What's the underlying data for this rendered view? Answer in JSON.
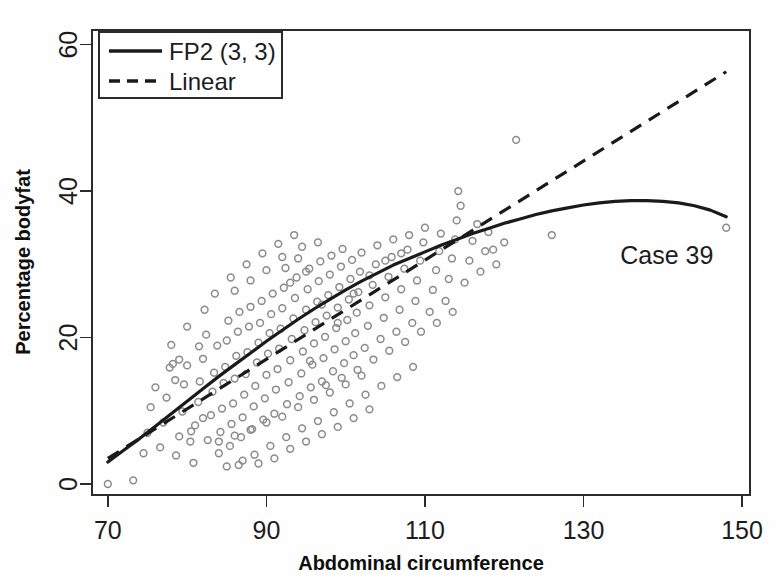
{
  "chart_data": {
    "type": "scatter",
    "title": "",
    "xlabel": "Abdominal circumference",
    "ylabel": "Percentage bodyfat",
    "xlim": [
      68,
      151
    ],
    "ylim": [
      -1.5,
      62
    ],
    "xticks": [
      70,
      90,
      110,
      130,
      150
    ],
    "yticks": [
      0,
      20,
      40,
      60
    ],
    "xtick_labels": [
      "70",
      "90",
      "110",
      "130",
      "150"
    ],
    "ytick_labels": [
      "0",
      "20",
      "40",
      "60"
    ],
    "grid": false,
    "legend_position": "top-left",
    "legend": [
      {
        "label": "FP2 (3, 3)",
        "style": "solid"
      },
      {
        "label": "Linear",
        "style": "dashed"
      }
    ],
    "annotations": [
      {
        "text": "Case 39",
        "x": 140.5,
        "y": 30.0
      }
    ],
    "series": [
      {
        "name": "FP2 (3, 3)",
        "type": "line",
        "style": "solid",
        "points": [
          [
            70,
            3.0
          ],
          [
            72,
            4.6
          ],
          [
            74,
            6.2
          ],
          [
            76,
            7.9
          ],
          [
            78,
            9.6
          ],
          [
            80,
            11.3
          ],
          [
            82,
            13.0
          ],
          [
            84,
            14.7
          ],
          [
            86,
            16.3
          ],
          [
            88,
            17.9
          ],
          [
            90,
            19.5
          ],
          [
            92,
            21.0
          ],
          [
            94,
            22.5
          ],
          [
            96,
            23.9
          ],
          [
            98,
            25.2
          ],
          [
            100,
            26.5
          ],
          [
            102,
            27.7
          ],
          [
            104,
            28.8
          ],
          [
            106,
            29.9
          ],
          [
            108,
            30.8
          ],
          [
            110,
            31.7
          ],
          [
            112,
            32.6
          ],
          [
            114,
            33.4
          ],
          [
            116,
            34.2
          ],
          [
            118,
            34.9
          ],
          [
            120,
            35.6
          ],
          [
            122,
            36.2
          ],
          [
            124,
            36.8
          ],
          [
            126,
            37.3
          ],
          [
            128,
            37.7
          ],
          [
            130,
            38.1
          ],
          [
            132,
            38.4
          ],
          [
            134,
            38.6
          ],
          [
            136,
            38.7
          ],
          [
            138,
            38.7
          ],
          [
            140,
            38.6
          ],
          [
            142,
            38.4
          ],
          [
            144,
            38.0
          ],
          [
            146,
            37.4
          ],
          [
            148,
            36.5
          ]
        ]
      },
      {
        "name": "Linear",
        "type": "line",
        "style": "dashed",
        "points": [
          [
            70,
            3.5
          ],
          [
            148,
            56.3
          ]
        ]
      }
    ],
    "scatter_points": [
      [
        70.0,
        0.0
      ],
      [
        73.2,
        0.5
      ],
      [
        74.5,
        4.2
      ],
      [
        75.0,
        7.0
      ],
      [
        75.4,
        10.5
      ],
      [
        76.0,
        13.2
      ],
      [
        76.6,
        5.0
      ],
      [
        77.0,
        8.4
      ],
      [
        77.4,
        11.8
      ],
      [
        77.8,
        15.9
      ],
      [
        78.2,
        16.4
      ],
      [
        78.6,
        3.9
      ],
      [
        79.0,
        6.5
      ],
      [
        79.4,
        9.9
      ],
      [
        79.6,
        13.6
      ],
      [
        80.0,
        16.2
      ],
      [
        80.4,
        5.8
      ],
      [
        80.8,
        2.9
      ],
      [
        81.0,
        8.0
      ],
      [
        81.4,
        11.2
      ],
      [
        81.6,
        14.0
      ],
      [
        82.0,
        17.1
      ],
      [
        82.4,
        20.4
      ],
      [
        82.6,
        6.0
      ],
      [
        83.0,
        9.4
      ],
      [
        83.2,
        12.6
      ],
      [
        83.4,
        15.2
      ],
      [
        83.8,
        18.9
      ],
      [
        84.0,
        4.2
      ],
      [
        84.2,
        7.1
      ],
      [
        84.4,
        10.3
      ],
      [
        84.6,
        13.8
      ],
      [
        84.8,
        16.0
      ],
      [
        85.0,
        19.6
      ],
      [
        85.2,
        22.3
      ],
      [
        85.4,
        5.2
      ],
      [
        85.6,
        8.2
      ],
      [
        85.8,
        11.0
      ],
      [
        86.0,
        14.4
      ],
      [
        86.2,
        17.5
      ],
      [
        86.4,
        20.8
      ],
      [
        86.6,
        23.5
      ],
      [
        86.8,
        6.4
      ],
      [
        87.0,
        9.1
      ],
      [
        87.2,
        12.2
      ],
      [
        87.4,
        15.0
      ],
      [
        87.6,
        18.0
      ],
      [
        87.8,
        21.5
      ],
      [
        88.0,
        24.2
      ],
      [
        88.2,
        7.5
      ],
      [
        88.4,
        10.6
      ],
      [
        88.6,
        13.4
      ],
      [
        88.8,
        16.6
      ],
      [
        89.0,
        19.3
      ],
      [
        89.2,
        22.0
      ],
      [
        89.4,
        25.0
      ],
      [
        89.6,
        8.8
      ],
      [
        89.8,
        11.7
      ],
      [
        90.0,
        14.9
      ],
      [
        90.2,
        17.8
      ],
      [
        90.4,
        20.6
      ],
      [
        90.6,
        23.2
      ],
      [
        90.8,
        26.0
      ],
      [
        91.0,
        9.6
      ],
      [
        91.2,
        12.9
      ],
      [
        91.4,
        15.7
      ],
      [
        91.6,
        18.5
      ],
      [
        91.8,
        21.2
      ],
      [
        92.0,
        24.0
      ],
      [
        92.2,
        26.8
      ],
      [
        92.4,
        29.5
      ],
      [
        92.6,
        10.9
      ],
      [
        92.8,
        13.9
      ],
      [
        93.0,
        16.9
      ],
      [
        93.2,
        19.8
      ],
      [
        93.4,
        22.6
      ],
      [
        93.6,
        25.4
      ],
      [
        93.8,
        28.2
      ],
      [
        94.0,
        30.8
      ],
      [
        94.2,
        12.0
      ],
      [
        94.4,
        15.1
      ],
      [
        94.6,
        18.1
      ],
      [
        94.8,
        21.0
      ],
      [
        95.0,
        23.8
      ],
      [
        95.2,
        26.6
      ],
      [
        95.4,
        29.4
      ],
      [
        95.6,
        13.2
      ],
      [
        95.8,
        16.3
      ],
      [
        96.0,
        19.2
      ],
      [
        96.2,
        22.1
      ],
      [
        96.4,
        24.9
      ],
      [
        96.6,
        27.7
      ],
      [
        96.8,
        30.4
      ],
      [
        97.0,
        14.0
      ],
      [
        97.2,
        17.2
      ],
      [
        97.4,
        20.1
      ],
      [
        97.6,
        23.0
      ],
      [
        97.8,
        25.8
      ],
      [
        98.0,
        28.6
      ],
      [
        98.2,
        31.2
      ],
      [
        98.4,
        15.4
      ],
      [
        98.6,
        18.4
      ],
      [
        98.8,
        21.3
      ],
      [
        99.0,
        24.1
      ],
      [
        99.2,
        26.9
      ],
      [
        99.4,
        29.7
      ],
      [
        99.6,
        32.1
      ],
      [
        99.8,
        16.5
      ],
      [
        100.0,
        19.5
      ],
      [
        100.2,
        22.4
      ],
      [
        100.4,
        25.2
      ],
      [
        100.6,
        28.0
      ],
      [
        100.8,
        30.6
      ],
      [
        101.0,
        17.6
      ],
      [
        101.2,
        20.6
      ],
      [
        101.4,
        23.4
      ],
      [
        101.6,
        26.2
      ],
      [
        101.8,
        29.0
      ],
      [
        102.0,
        31.6
      ],
      [
        102.4,
        18.6
      ],
      [
        102.8,
        21.6
      ],
      [
        103.0,
        24.4
      ],
      [
        103.4,
        27.2
      ],
      [
        103.8,
        30.0
      ],
      [
        104.0,
        32.6
      ],
      [
        104.4,
        19.8
      ],
      [
        104.8,
        22.7
      ],
      [
        105.0,
        25.5
      ],
      [
        105.4,
        28.3
      ],
      [
        105.8,
        31.0
      ],
      [
        106.0,
        33.4
      ],
      [
        106.4,
        20.8
      ],
      [
        106.8,
        23.8
      ],
      [
        107.0,
        26.6
      ],
      [
        107.4,
        29.4
      ],
      [
        107.8,
        32.0
      ],
      [
        108.0,
        34.0
      ],
      [
        108.4,
        22.0
      ],
      [
        108.8,
        25.0
      ],
      [
        109.0,
        27.8
      ],
      [
        109.4,
        30.5
      ],
      [
        109.8,
        33.0
      ],
      [
        110.0,
        35.0
      ],
      [
        110.6,
        23.5
      ],
      [
        111.0,
        26.5
      ],
      [
        111.4,
        29.2
      ],
      [
        111.8,
        31.8
      ],
      [
        112.0,
        34.2
      ],
      [
        112.6,
        25.0
      ],
      [
        113.0,
        28.0
      ],
      [
        113.4,
        30.8
      ],
      [
        113.8,
        33.4
      ],
      [
        114.0,
        36.0
      ],
      [
        114.5,
        38.0
      ],
      [
        114.2,
        40.0
      ],
      [
        115.0,
        27.5
      ],
      [
        115.6,
        30.5
      ],
      [
        116.0,
        33.2
      ],
      [
        116.6,
        35.5
      ],
      [
        117.0,
        29.0
      ],
      [
        117.6,
        31.8
      ],
      [
        118.0,
        34.4
      ],
      [
        118.6,
        32.0
      ],
      [
        119.0,
        30.0
      ],
      [
        120.0,
        33.0
      ],
      [
        121.5,
        47.0
      ],
      [
        126.0,
        34.0
      ],
      [
        148.0,
        35.0
      ],
      [
        78.0,
        19.0
      ],
      [
        82.2,
        23.8
      ],
      [
        86.0,
        26.4
      ],
      [
        88.0,
        27.8
      ],
      [
        90.0,
        29.2
      ],
      [
        92.0,
        31.0
      ],
      [
        94.5,
        32.4
      ],
      [
        96.5,
        33.0
      ],
      [
        86.5,
        2.6
      ],
      [
        88.5,
        4.0
      ],
      [
        90.5,
        5.2
      ],
      [
        92.5,
        6.4
      ],
      [
        94.5,
        7.6
      ],
      [
        96.5,
        8.6
      ],
      [
        98.5,
        9.8
      ],
      [
        100.5,
        11.0
      ],
      [
        102.5,
        12.2
      ],
      [
        104.5,
        13.4
      ],
      [
        106.5,
        14.6
      ],
      [
        108.5,
        16.0
      ],
      [
        83.5,
        26.0
      ],
      [
        85.5,
        28.2
      ],
      [
        87.5,
        30.0
      ],
      [
        89.5,
        31.5
      ],
      [
        91.5,
        32.8
      ],
      [
        93.5,
        34.0
      ],
      [
        80.0,
        21.5
      ],
      [
        81.5,
        18.8
      ],
      [
        79.0,
        17.0
      ],
      [
        78.5,
        14.2
      ],
      [
        91.0,
        3.5
      ],
      [
        93.0,
        4.8
      ],
      [
        95.0,
        5.8
      ],
      [
        97.0,
        6.8
      ],
      [
        99.0,
        7.8
      ],
      [
        101.0,
        9.0
      ],
      [
        103.0,
        10.2
      ],
      [
        87.0,
        3.2
      ],
      [
        85.0,
        2.4
      ],
      [
        89.0,
        2.8
      ],
      [
        95.5,
        16.8
      ],
      [
        97.5,
        13.5
      ],
      [
        99.5,
        14.5
      ],
      [
        101.5,
        15.6
      ],
      [
        103.5,
        17.0
      ],
      [
        105.5,
        18.2
      ],
      [
        107.5,
        19.4
      ],
      [
        109.5,
        20.8
      ],
      [
        111.5,
        22.0
      ],
      [
        113.5,
        23.5
      ],
      [
        94.0,
        10.5
      ],
      [
        96.0,
        11.5
      ],
      [
        98.0,
        12.5
      ],
      [
        100.0,
        13.6
      ],
      [
        102.0,
        14.8
      ],
      [
        92.0,
        9.2
      ],
      [
        90.0,
        8.4
      ],
      [
        88.0,
        7.4
      ],
      [
        86.0,
        6.6
      ],
      [
        84.0,
        5.8
      ],
      [
        93.0,
        27.5
      ],
      [
        95.0,
        29.0
      ],
      [
        97.0,
        24.5
      ],
      [
        99.0,
        22.0
      ],
      [
        101.0,
        26.0
      ],
      [
        103.0,
        28.5
      ],
      [
        105.0,
        30.5
      ],
      [
        107.0,
        31.5
      ],
      [
        82.0,
        9.0
      ],
      [
        80.5,
        7.2
      ]
    ]
  },
  "layout": {
    "plot_left": 92,
    "plot_right": 750,
    "plot_top": 30,
    "plot_bottom": 495
  }
}
